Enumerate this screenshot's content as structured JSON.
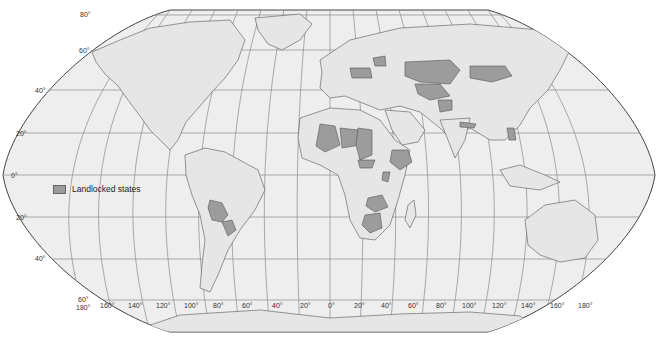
{
  "map": {
    "projection": "Robinson (world)",
    "colors": {
      "ocean": "#eeeeee",
      "land": "#e8e8e8",
      "landlocked": "#9c9c9c",
      "border": "#555555",
      "graticule": "#8a8a8a",
      "frame": "#444444"
    },
    "legend": {
      "label": "Landlocked states"
    },
    "latitude_labels": [
      {
        "text": "80°",
        "lat": 80
      },
      {
        "text": "60°",
        "lat": 60
      },
      {
        "text": "40°",
        "lat": 40
      },
      {
        "text": "20°",
        "lat": 20
      },
      {
        "text": "0°",
        "lat": 0
      },
      {
        "text": "20°",
        "lat": -20
      },
      {
        "text": "40°",
        "lat": -40
      },
      {
        "text": "60°",
        "lat": -60
      }
    ],
    "longitude_labels": [
      "180°",
      "160°",
      "140°",
      "120°",
      "100°",
      "80°",
      "60°",
      "40°",
      "20°",
      "0°",
      "20°",
      "40°",
      "60°",
      "80°",
      "100°",
      "120°",
      "140°",
      "160°",
      "180°"
    ],
    "landlocked_regions": [
      "Bolivia",
      "Paraguay",
      "Mali",
      "Burkina Faso",
      "Niger",
      "Chad",
      "Central African Republic",
      "Ethiopia",
      "Uganda",
      "Rwanda",
      "Burundi",
      "Zambia",
      "Malawi",
      "Zimbabwe",
      "Botswana",
      "Lesotho",
      "Swaziland",
      "Belarus",
      "Czech Republic",
      "Slovakia",
      "Austria",
      "Hungary",
      "Switzerland",
      "Serbia",
      "Macedonia",
      "Moldova",
      "Kazakhstan",
      "Uzbekistan",
      "Turkmenistan",
      "Kyrgyzstan",
      "Tajikistan",
      "Afghanistan",
      "Mongolia",
      "Nepal",
      "Bhutan",
      "Laos"
    ]
  }
}
